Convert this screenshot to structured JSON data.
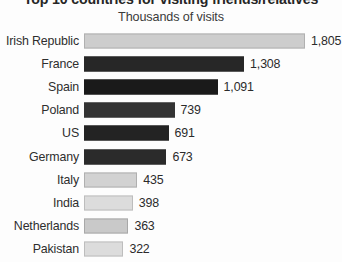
{
  "chart_data": {
    "type": "bar",
    "orientation": "horizontal",
    "title": "Top 10 countries for visiting friends/relatives",
    "subtitle": "Thousands of visits",
    "xlabel": "",
    "ylabel": "",
    "grid": false,
    "legend": "none",
    "xlim": [
      0,
      1805
    ],
    "categories": [
      "Irish Republic",
      "France",
      "Spain",
      "Poland",
      "US",
      "Germany",
      "Italy",
      "India",
      "Netherlands",
      "Pakistan"
    ],
    "values": [
      1805,
      1308,
      1091,
      739,
      691,
      673,
      435,
      398,
      363,
      322
    ],
    "value_labels": [
      "1,805",
      "1,308",
      "1,091",
      "739",
      "691",
      "673",
      "435",
      "398",
      "363",
      "322"
    ],
    "bar_colors": [
      "#cdcdcd",
      "#272727",
      "#1a1a1a",
      "#333333",
      "#232323",
      "#2b2b2b",
      "#d2d2d2",
      "#dcdcdc",
      "#c9c9c9",
      "#dcdcdc"
    ],
    "bar_styles": [
      "light",
      "dark",
      "dark",
      "dark2",
      "dark",
      "dark",
      "light",
      "lightest",
      "light2",
      "lightest"
    ]
  },
  "colors": {
    "background": "#fdfdfd",
    "title_text": "#262626",
    "subtitle_text": "#3a3a3a",
    "category_text": "#2e2e2e",
    "value_text": "#2b2b2b",
    "bar_light": "#cdcdcd",
    "bar_dark": "#1c1c1c",
    "bar_border_light": "#b0b0b0"
  }
}
